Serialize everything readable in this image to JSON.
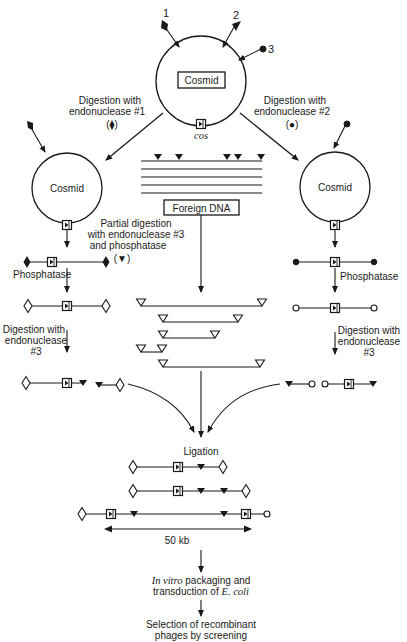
{
  "diagram": {
    "top_cosmid": {
      "label": "Cosmid",
      "cos_label": "cos",
      "site_numbers": [
        "1",
        "3",
        "2"
      ]
    },
    "left_branch": {
      "digestion_label_line1": "Digestion with",
      "digestion_label_line2": "endonuclease #1",
      "symbol_label": "(⧫)",
      "cosmid_label": "Cosmid",
      "phosphatase_label": "Phosphatase",
      "digestion3_line1": "Digestion with",
      "digestion3_line2": "endonuclease",
      "digestion3_line3": "#3"
    },
    "right_branch": {
      "digestion_label_line1": "Digestion with",
      "digestion_label_line2": "endonuclease #2",
      "symbol_label": "(●)",
      "cosmid_label": "Cosmid",
      "phosphatase_label": "Phosphatase",
      "digestion3_line1": "Digestion with",
      "digestion3_line2": "endonuclease",
      "digestion3_line3": "#3"
    },
    "center_branch": {
      "foreign_dna_label": "Foreign DNA",
      "partial_line1": "Partial digestion",
      "partial_line2": "with endonuclease #3",
      "partial_line3": "and phosphatase",
      "symbol_label": "(▼)"
    },
    "ligation": {
      "label": "Ligation",
      "scale_label": "50 kb"
    },
    "final_steps": {
      "packaging_italic": "In vitro",
      "packaging_rest": " packaging and",
      "transduction_prefix": "transduction of ",
      "transduction_italic": "E. coli",
      "selection_line1": "Selection of recombinant",
      "selection_line2": "phages by screening"
    },
    "legend_symbols": {
      "endonuclease_1": "filled-diamond",
      "endonuclease_2": "filled-circle",
      "endonuclease_3": "filled-triangle",
      "dephosphorylated_1": "open-diamond",
      "dephosphorylated_2": "open-circle",
      "dephosphorylated_3": "open-triangle",
      "cos_site": "boxed-cos"
    }
  }
}
